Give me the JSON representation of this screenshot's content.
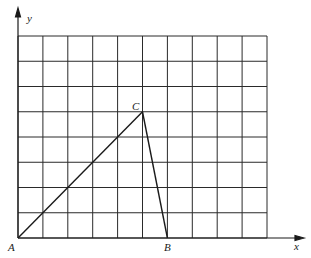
{
  "diagram": {
    "type": "coordinate-grid-triangle",
    "grid": {
      "columns": 10,
      "rows": 8
    },
    "axes": {
      "x_label": "x",
      "y_label": "y"
    },
    "points": [
      {
        "name": "A",
        "x": 0,
        "y": 0
      },
      {
        "name": "B",
        "x": 6,
        "y": 0
      },
      {
        "name": "C",
        "x": 5,
        "y": 5
      }
    ],
    "segments": [
      [
        "A",
        "C"
      ],
      [
        "C",
        "B"
      ]
    ],
    "colors": {
      "line": "#1a1a1a",
      "background": "#ffffff"
    }
  },
  "labels": {
    "A": "A",
    "B": "B",
    "C": "C",
    "x": "x",
    "y": "y"
  }
}
